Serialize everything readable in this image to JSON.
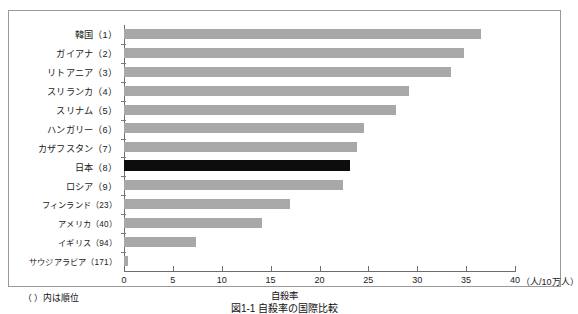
{
  "chart_data": {
    "type": "bar",
    "orientation": "horizontal",
    "title": "図1-1 自殺率の国際比較",
    "xlabel": "自殺率",
    "ylabel": "",
    "unit_label": "（人/10万人）",
    "note": "（ ）内は順位",
    "xlim": [
      0,
      40
    ],
    "xticks": [
      0,
      5,
      10,
      15,
      20,
      25,
      30,
      35,
      40
    ],
    "xtick_labels": [
      "0",
      "5",
      "10",
      "15",
      "20",
      "25",
      "30",
      "35",
      "40"
    ],
    "grid": false,
    "legend": "none",
    "bar_color": "#a8a8a8",
    "highlight_color": "#0d0d0d",
    "highlight_category": "日本（8）",
    "categories": [
      "韓国（1）",
      "ガイアナ（2）",
      "リトアニア（3）",
      "スリランカ（4）",
      "スリナム（5）",
      "ハンガリー（6）",
      "カザフスタン（7）",
      "日本（8）",
      "ロシア（9）",
      "フィンランド（23）",
      "アメリカ（40）",
      "イギリス（94）",
      "サウジアラビア（171）"
    ],
    "values": [
      36.5,
      34.8,
      33.5,
      29.2,
      27.8,
      24.6,
      23.8,
      23.1,
      22.4,
      17.0,
      14.1,
      7.4,
      0.4
    ],
    "ranks": [
      1,
      2,
      3,
      4,
      5,
      6,
      7,
      8,
      9,
      23,
      40,
      94,
      171
    ]
  }
}
